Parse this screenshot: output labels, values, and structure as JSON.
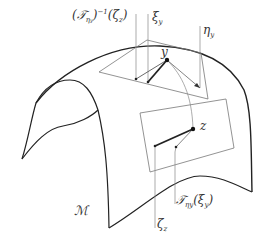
{
  "diagram": {
    "type": "manifold-tangent-spaces",
    "colors": {
      "manifold_outline": "#222222",
      "plane": "#666666",
      "vector": "#222222",
      "leader": "#777777",
      "label": "#333333"
    },
    "labels": {
      "inverse_transport": "(𝒯",
      "inverse_transport_sub": "η",
      "inverse_transport_subsub": "y",
      "inverse_transport_rest": ")",
      "inverse_transport_sup": "−1",
      "inverse_transport_arg": "(ζ",
      "inverse_transport_arg_sub": "z",
      "inverse_transport_close": ")",
      "xi_y": "ξ",
      "xi_y_sub": "y",
      "eta_y": "η",
      "eta_y_sub": "y",
      "point_y": "y",
      "point_z": "z",
      "transport": "𝒯",
      "transport_sub": "ηy",
      "transport_arg": "(ξ",
      "transport_arg_sub": "y",
      "transport_close": ")",
      "zeta_z": "ζ",
      "zeta_z_sub": "z",
      "manifold": "ℳ"
    },
    "points": {
      "y": [
        167,
        60
      ],
      "z": [
        193,
        129
      ]
    },
    "tangent_planes": [
      {
        "name": "T_y M",
        "corners": [
          [
            99,
            72
          ],
          [
            147,
            40
          ],
          [
            201,
            53
          ],
          [
            208,
            99
          ]
        ]
      },
      {
        "name": "T_z M",
        "corners": [
          [
            140,
            113
          ],
          [
            226,
            99
          ],
          [
            234,
            148
          ],
          [
            150,
            172
          ]
        ]
      }
    ],
    "vectors": [
      {
        "name": "xi_y",
        "from": [
          167,
          60
        ],
        "to": [
          148,
          82
        ],
        "weight": "bold"
      },
      {
        "name": "inverse_transport_zeta_z",
        "from": [
          167,
          60
        ],
        "to": [
          136,
          79
        ],
        "weight": "thin"
      },
      {
        "name": "eta_y",
        "from": [
          167,
          60
        ],
        "to": [
          200,
          88
        ],
        "weight": "thin"
      },
      {
        "name": "zeta_z",
        "from": [
          193,
          129
        ],
        "to": [
          155,
          146
        ],
        "weight": "bold"
      },
      {
        "name": "transport_xi_y",
        "from": [
          193,
          129
        ],
        "to": [
          176,
          147
        ],
        "weight": "thin"
      }
    ]
  }
}
